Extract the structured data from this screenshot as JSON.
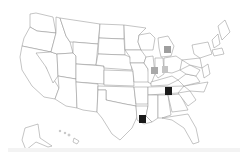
{
  "map": {
    "region": "United States",
    "style": "state outline map",
    "outline_color": "#8a8a8a",
    "fill_color": "#ffffff"
  },
  "markers": [
    {
      "state": "Michigan",
      "x": 164,
      "y": 46,
      "w": 7,
      "h": 7,
      "color": "#9e9e9e"
    },
    {
      "state": "Illinois",
      "x": 151,
      "y": 67,
      "w": 7,
      "h": 7,
      "color": "#a8a8a8"
    },
    {
      "state": "Indiana",
      "x": 162,
      "y": 66,
      "w": 6,
      "h": 7,
      "color": "#c4c4c4"
    },
    {
      "state": "Tennessee",
      "x": 165,
      "y": 87,
      "w": 7,
      "h": 8,
      "color": "#1a1a1a"
    },
    {
      "state": "Louisiana",
      "x": 139,
      "y": 115,
      "w": 7,
      "h": 8,
      "color": "#1a1a1a"
    }
  ],
  "legend": {
    "gray": "#a8a8a8",
    "black": "#1a1a1a"
  }
}
